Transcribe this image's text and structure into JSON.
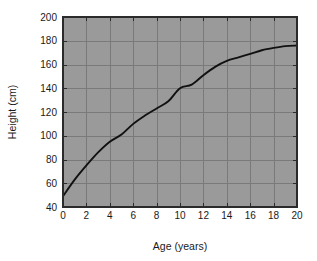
{
  "chart_data": {
    "type": "line",
    "title": "",
    "xlabel": "Age (years)",
    "ylabel": "Height (cm)",
    "xlim": [
      0,
      20
    ],
    "ylim": [
      40,
      200
    ],
    "xticks": [
      0,
      2,
      4,
      6,
      8,
      10,
      12,
      14,
      16,
      18,
      20
    ],
    "yticks": [
      40,
      60,
      80,
      100,
      120,
      140,
      160,
      180,
      200
    ],
    "xtick_labels": [
      "0",
      "2",
      "4",
      "6",
      "8",
      "10",
      "12",
      "14",
      "16",
      "18",
      "20"
    ],
    "ytick_labels": [
      "40",
      "60",
      "80",
      "100",
      "120",
      "140",
      "160",
      "180",
      "200"
    ],
    "grid": true,
    "legend": "none",
    "plot_background_color": "#9a9a9a",
    "gridline_color": "#7a7a7a",
    "curve_color": "#111111",
    "figure_background_color": "#ffffff",
    "series": [
      {
        "name": "Height vs Age",
        "x": [
          0,
          1,
          2,
          3,
          4,
          5,
          6,
          7,
          8,
          9,
          10,
          11,
          12,
          13,
          14,
          15,
          16,
          17,
          18,
          19,
          20
        ],
        "values": [
          49,
          63,
          75,
          86,
          95,
          101,
          110,
          117,
          123,
          129,
          140,
          143,
          151,
          158,
          163,
          166,
          169,
          172,
          174,
          175.5,
          176
        ]
      }
    ]
  },
  "axes": {
    "x_title": "Age (years)",
    "y_title": "Height (cm)"
  }
}
